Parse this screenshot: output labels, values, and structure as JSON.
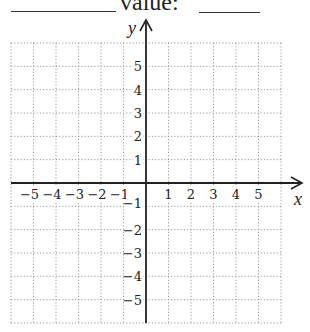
{
  "header": {
    "word": "value:",
    "blanks": [
      {
        "name": "answer-blank-1",
        "x1": 11,
        "x2": 116,
        "y": 11
      },
      {
        "name": "answer-blank-2",
        "x1": 199,
        "x2": 260,
        "y": 12
      }
    ]
  },
  "chart_data": {
    "type": "scatter",
    "title": "",
    "xlabel": "x",
    "ylabel": "y",
    "xlim": [
      -6,
      6
    ],
    "ylim": [
      -6,
      6
    ],
    "grid": true,
    "grid_style": "dotted",
    "x_ticks": [
      -5,
      -4,
      -3,
      -2,
      -1,
      1,
      2,
      3,
      4,
      5
    ],
    "y_ticks": [
      5,
      4,
      3,
      2,
      1,
      -1,
      -2,
      -3,
      -4,
      -5
    ],
    "x_tick_labels": [
      "−5",
      "−4",
      "−3",
      "−2",
      "−1",
      "1",
      "2",
      "3",
      "4",
      "5"
    ],
    "y_tick_labels": [
      "5",
      "4",
      "3",
      "2",
      "1",
      "−1",
      "−2",
      "−3",
      "−4",
      "−5"
    ],
    "series": [],
    "legend": null
  },
  "colors": {
    "axis": "#222222",
    "grid": "#9a9a9a",
    "text": "#222222"
  }
}
